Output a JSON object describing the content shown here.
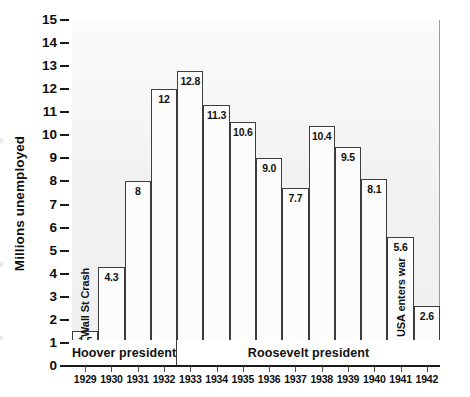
{
  "chart_data": {
    "type": "bar",
    "title": "",
    "xlabel": "",
    "ylabel": "Millions unemployed",
    "ylim": [
      0,
      15
    ],
    "grid": false,
    "legend": null,
    "categories": [
      "1929",
      "1930",
      "1931",
      "1932",
      "1933",
      "1934",
      "1935",
      "1936",
      "1937",
      "1938",
      "1939",
      "1940",
      "1941",
      "1942"
    ],
    "values": [
      1.5,
      4.3,
      8,
      12,
      12.8,
      11.3,
      10.6,
      9.0,
      7.7,
      10.4,
      9.5,
      8.1,
      5.6,
      2.6
    ],
    "value_labels": [
      "1.5",
      "4.3",
      "8",
      "12",
      "12.8",
      "11.3",
      "10.6",
      "9.0",
      "7.7",
      "10.4",
      "9.5",
      "8.1",
      "5.6",
      "2.6"
    ],
    "y_ticks": [
      0,
      1,
      2,
      3,
      4,
      5,
      6,
      7,
      8,
      9,
      10,
      11,
      12,
      13,
      14,
      15
    ],
    "y_tick_labels": [
      "0",
      "1",
      "2",
      "3",
      "4",
      "5",
      "6",
      "7",
      "8",
      "9",
      "10",
      "11",
      "12",
      "13",
      "14",
      "15"
    ],
    "annotations": [
      {
        "text": "Wall St Crash",
        "category": "1929",
        "orientation": "vertical"
      },
      {
        "text": "USA enters war",
        "category": "1941",
        "orientation": "vertical"
      }
    ],
    "bands": [
      {
        "label": "Hoover president",
        "from": "1929",
        "to": "1932"
      },
      {
        "label": "Roosevelt president",
        "from": "1933",
        "to": "1942"
      }
    ],
    "colors": {
      "bar_fill": "#fcfcfc",
      "bar_stroke": "#3d3d3d",
      "plot_background": "#f2f2f2",
      "axis": "#1a1a1a",
      "text": "#111111"
    }
  }
}
